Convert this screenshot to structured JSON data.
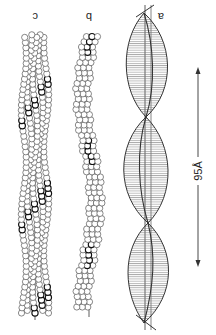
{
  "figure": {
    "orientation": "rotated 180 degrees",
    "panels": [
      {
        "id": "a",
        "label": "a",
        "description": "two-stranded helical ribbon model with hatching"
      },
      {
        "id": "b",
        "label": "b",
        "description": "single-strand bead (subunit) model"
      },
      {
        "id": "c",
        "label": "c",
        "description": "double-strand bead (subunit) model"
      }
    ],
    "scale_bar": {
      "label": "95Å",
      "value": 95,
      "unit": "Å"
    },
    "colors": {
      "ink": "#2a2a2a",
      "hatch": "#666666",
      "paper": "#ffffff",
      "bead_fill": "#ffffff"
    }
  }
}
